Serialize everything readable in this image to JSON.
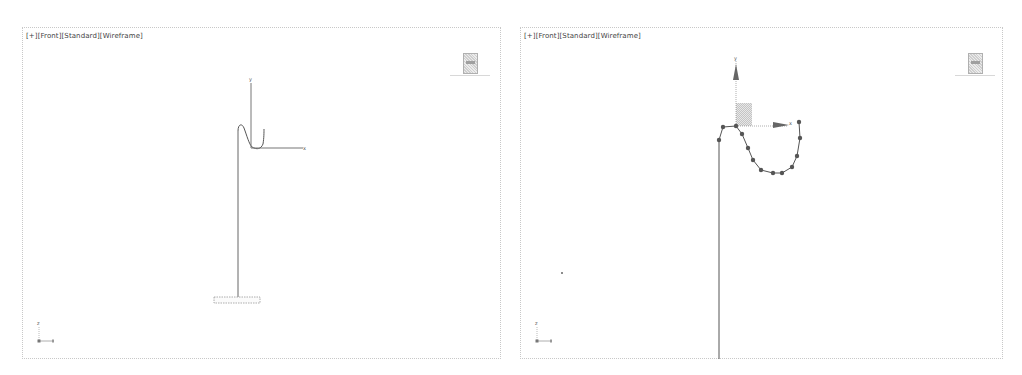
{
  "viewports": [
    {
      "id": "left",
      "label_parts": [
        "[+]",
        "[Front]",
        "[Standard]",
        "[Wireframe]"
      ],
      "gizmo": {
        "y_label": "y",
        "x_label": "x"
      },
      "tripod": {
        "z_label": "z",
        "x_label": "x"
      }
    },
    {
      "id": "right",
      "label_parts": [
        "[+]",
        "[Front]",
        "[Standard]",
        "[Wireframe]"
      ],
      "gizmo": {
        "y_label": "y",
        "x_label": "x"
      },
      "tripod": {
        "z_label": "z",
        "x_label": "x"
      }
    }
  ],
  "colors": {
    "border": "#c8c8c8",
    "wire": "#555555",
    "gizmo_axis": "#888888",
    "vertex": "#555555"
  }
}
